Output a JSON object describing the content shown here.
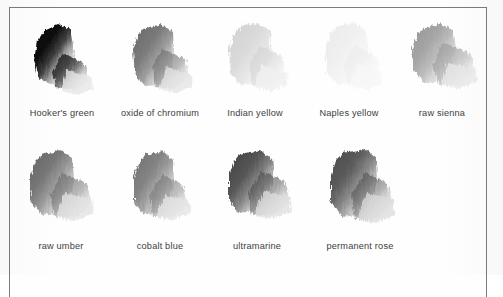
{
  "page": {
    "kind": "scanned-plate",
    "background_color": "#fdfdfd",
    "frame_color": "#7b7b7b",
    "caption_color": "#3d3d3d"
  },
  "plate": {
    "rows": [
      {
        "swatches": [
          {
            "label": "Hooker's green",
            "dark_tone": "#0d0d0d",
            "mid_tone": "#3a3a3a",
            "light_tone": "#d8d8d8",
            "wash_tone": "#f0f0f0"
          },
          {
            "label": "oxide of chromium",
            "dark_tone": "#6e6e6e",
            "mid_tone": "#848484",
            "light_tone": "#d2d2d2",
            "wash_tone": "#eeeeee"
          },
          {
            "label": "Indian yellow",
            "dark_tone": "#d3d3d3",
            "mid_tone": "#dcdcdc",
            "light_tone": "#ededed",
            "wash_tone": "#f7f7f7"
          },
          {
            "label": "Naples yellow",
            "dark_tone": "#ededed",
            "mid_tone": "#f1f1f1",
            "light_tone": "#f7f7f7",
            "wash_tone": "#fbfbfb"
          },
          {
            "label": "raw sienna",
            "dark_tone": "#9b9b9b",
            "mid_tone": "#acacac",
            "light_tone": "#d9d9d9",
            "wash_tone": "#f0f0f0"
          }
        ]
      },
      {
        "swatches": [
          {
            "label": "raw umber",
            "dark_tone": "#6b6b6b",
            "mid_tone": "#808080",
            "light_tone": "#cfcfcf",
            "wash_tone": "#ededed"
          },
          {
            "label": "cobalt blue",
            "dark_tone": "#767676",
            "mid_tone": "#8c8c8c",
            "light_tone": "#d4d4d4",
            "wash_tone": "#efefef"
          },
          {
            "label": "ultramarine",
            "dark_tone": "#4a4a4a",
            "mid_tone": "#616161",
            "light_tone": "#c6c6c6",
            "wash_tone": "#eaeaea"
          },
          {
            "label": "permanent rose",
            "dark_tone": "#4e4e4e",
            "mid_tone": "#6a6a6a",
            "light_tone": "#c9c9c9",
            "wash_tone": "#ececec"
          }
        ]
      }
    ]
  }
}
